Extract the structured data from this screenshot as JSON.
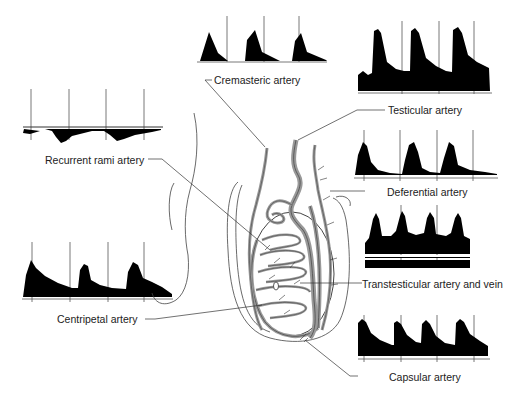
{
  "labels": {
    "cremasteric": "Cremasteric artery",
    "testicular": "Testicular artery",
    "recurrent_rami": "Recurrent rami artery",
    "deferential": "Deferential artery",
    "transtesticular": "Transtesticular artery and vein",
    "centripetal": "Centripetal artery",
    "capsular": "Capsular artery"
  },
  "colors": {
    "waveform": "#000000",
    "vessel_fill": "#a8a8a8",
    "outline": "#333333",
    "text": "#222222"
  },
  "waveforms": [
    {
      "name": "cremasteric",
      "pattern": "low-diastolic high-resistance",
      "peaks": 3
    },
    {
      "name": "testicular",
      "pattern": "low-resistance continuous diastolic flow",
      "peaks": 3
    },
    {
      "name": "recurrent_rami",
      "pattern": "reversed flow below baseline",
      "peaks": 3
    },
    {
      "name": "deferential",
      "pattern": "high-resistance sharp peaks",
      "peaks": 3
    },
    {
      "name": "transtesticular",
      "pattern": "arterial above baseline with venous band below",
      "peaks": 4
    },
    {
      "name": "centripetal",
      "pattern": "low-resistance",
      "peaks": 3
    },
    {
      "name": "capsular",
      "pattern": "low-resistance sawtooth",
      "peaks": 4
    }
  ]
}
